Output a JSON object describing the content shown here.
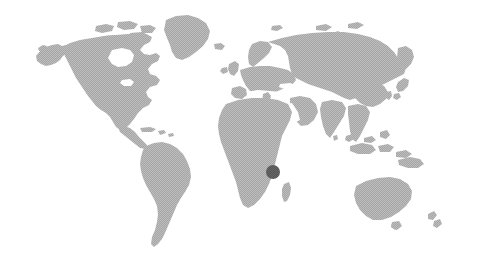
{
  "figure": {
    "type": "world-locator-map",
    "width": 485,
    "height": 266,
    "background_color": "#ffffff",
    "projection": "equirectangular-stylized",
    "caption": "",
    "title": ""
  },
  "map": {
    "land_color": "#a6a6a6",
    "land_texture": "dithered-halftone",
    "ocean_color": "#ffffff",
    "border_color": "none",
    "graticule": "none"
  },
  "markers": [
    {
      "name": "location-marker",
      "label": "Tanzania",
      "region": "East Africa",
      "color": "#565656",
      "shape": "circle",
      "radius_px": 7,
      "x_px": 273,
      "y_px": 172
    }
  ],
  "chart_data": {
    "type": "map",
    "title": "",
    "xlabel": "",
    "ylabel": "",
    "marker_count": 1,
    "highlighted_regions": [
      "Tanzania"
    ],
    "continents_shown": [
      "North America",
      "South America",
      "Greenland",
      "Europe",
      "Africa",
      "Asia",
      "Australia",
      "Madagascar",
      "New Zealand",
      "Japan",
      "Indonesia",
      "British Isles",
      "Caribbean"
    ],
    "land_fill": "#a6a6a6",
    "marker_fill": "#565656",
    "background": "#ffffff"
  }
}
